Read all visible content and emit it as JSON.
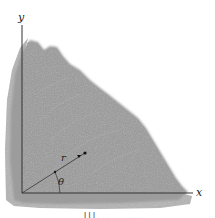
{
  "figure": {
    "type": "engineering-diagram",
    "axes": {
      "x_label": "x",
      "y_label": "y"
    },
    "polar": {
      "radius_label": "r",
      "angle_label": "θ"
    },
    "colors": {
      "plate_fill": "#9a9a9a",
      "plate_texture": "#b8b8b8",
      "axis_line": "#333333",
      "background": "#ffffff"
    },
    "caption": "Ill...  ..."
  }
}
